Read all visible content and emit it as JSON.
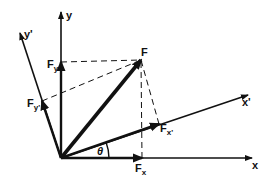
{
  "diagram": {
    "type": "vector-decomposition",
    "colors": {
      "ink": "#111111",
      "background": "#ffffff"
    },
    "origin": [
      61,
      158
    ],
    "axes": [
      {
        "id": "x",
        "label": "x",
        "end": [
          252,
          158
        ]
      },
      {
        "id": "y",
        "label": "y",
        "end": [
          61,
          12
        ]
      },
      {
        "id": "x_prime",
        "label": "x'",
        "end": [
          248,
          95
        ]
      },
      {
        "id": "y_prime",
        "label": "y'",
        "end": [
          20,
          33
        ]
      }
    ],
    "vectors": [
      {
        "id": "F",
        "label": "F",
        "end": [
          141,
          60
        ],
        "weight": "heavy"
      },
      {
        "id": "Fx",
        "label": "F",
        "sub": "x",
        "end": [
          142,
          158
        ]
      },
      {
        "id": "Fy",
        "label": "F",
        "sub": "y",
        "end": [
          61,
          62
        ]
      },
      {
        "id": "Fx_prime",
        "label": "F",
        "sub": "x'",
        "end": [
          159,
          124
        ]
      },
      {
        "id": "Fy_prime",
        "label": "F",
        "sub": "y'",
        "end": [
          42,
          101
        ]
      }
    ],
    "angle": {
      "label": "θ",
      "between": [
        "x",
        "x_prime"
      ]
    }
  }
}
